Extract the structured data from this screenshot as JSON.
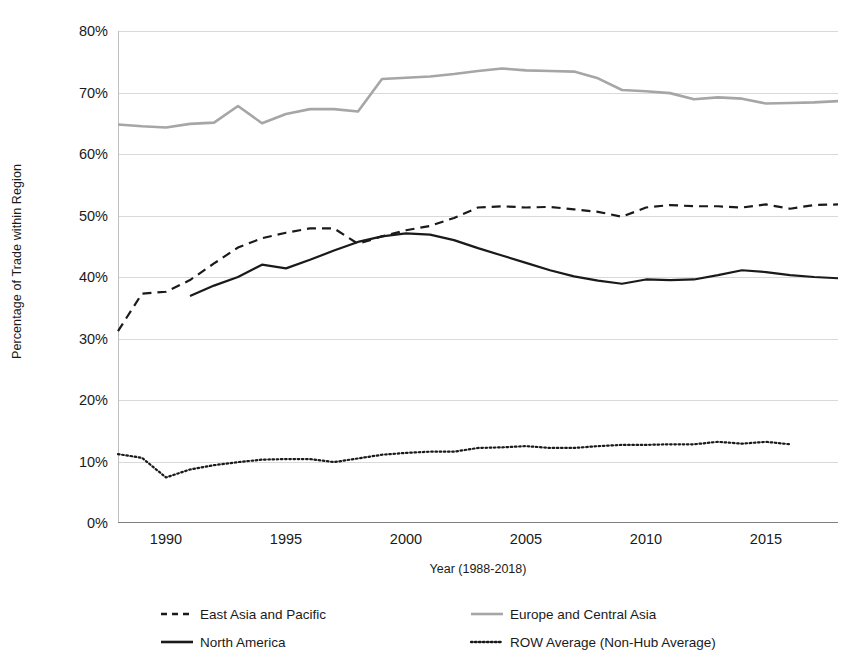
{
  "chart_data": {
    "type": "line",
    "title": "",
    "xlabel": "Year (1988-2018)",
    "ylabel": "Percentage of Trade within Region",
    "xlim": [
      1988,
      2018
    ],
    "ylim": [
      0,
      80
    ],
    "grid": true,
    "legend_position": "bottom",
    "y_ticks": [
      0,
      10,
      20,
      30,
      40,
      50,
      60,
      70,
      80
    ],
    "y_tick_labels": [
      "0%",
      "10%",
      "20%",
      "30%",
      "40%",
      "50%",
      "60%",
      "70%",
      "80%"
    ],
    "x_ticks": [
      1990,
      1995,
      2000,
      2005,
      2010,
      2015
    ],
    "x_tick_labels": [
      "1990",
      "1995",
      "2000",
      "2005",
      "2010",
      "2015"
    ],
    "series": [
      {
        "name": "East Asia and Pacific",
        "style": "dashed",
        "color": "#1a1a1a",
        "x": [
          1988,
          1989,
          1990,
          1991,
          1992,
          1993,
          1994,
          1995,
          1996,
          1997,
          1998,
          1999,
          2000,
          2001,
          2002,
          2003,
          2004,
          2005,
          2006,
          2007,
          2008,
          2009,
          2010,
          2011,
          2012,
          2013,
          2014,
          2015,
          2016,
          2017,
          2018
        ],
        "values": [
          31.2,
          37.3,
          37.6,
          39.5,
          42.2,
          44.8,
          46.3,
          47.2,
          47.9,
          47.9,
          45.4,
          46.6,
          47.6,
          48.3,
          49.6,
          51.3,
          51.5,
          51.3,
          51.4,
          51.0,
          50.6,
          49.8,
          51.3,
          51.7,
          51.5,
          51.5,
          51.3,
          51.8,
          51.1,
          51.7,
          51.8
        ]
      },
      {
        "name": "Europe and Central Asia",
        "style": "solid",
        "color": "#a6a6a6",
        "x": [
          1988,
          1989,
          1990,
          1991,
          1992,
          1993,
          1994,
          1995,
          1996,
          1997,
          1998,
          1999,
          2000,
          2001,
          2002,
          2003,
          2004,
          2005,
          2006,
          2007,
          2008,
          2009,
          2010,
          2011,
          2012,
          2013,
          2014,
          2015,
          2016,
          2017,
          2018
        ],
        "values": [
          64.8,
          64.5,
          64.3,
          64.9,
          65.1,
          67.8,
          65.0,
          66.5,
          67.3,
          67.3,
          66.9,
          72.2,
          72.4,
          72.6,
          73.0,
          73.5,
          73.9,
          73.6,
          73.5,
          73.4,
          72.3,
          70.4,
          70.2,
          69.9,
          68.9,
          69.2,
          69.0,
          68.2,
          68.3,
          68.4,
          68.6
        ]
      },
      {
        "name": "North America",
        "style": "solid",
        "color": "#1a1a1a",
        "x": [
          1991,
          1992,
          1993,
          1994,
          1995,
          1996,
          1997,
          1998,
          1999,
          2000,
          2001,
          2002,
          2003,
          2004,
          2005,
          2006,
          2007,
          2008,
          2009,
          2010,
          2011,
          2012,
          2013,
          2014,
          2015,
          2016,
          2017,
          2018
        ],
        "values": [
          36.9,
          38.6,
          40.0,
          42.0,
          41.4,
          42.8,
          44.3,
          45.7,
          46.6,
          47.1,
          46.9,
          46.0,
          44.7,
          43.5,
          42.3,
          41.1,
          40.1,
          39.4,
          38.9,
          39.6,
          39.5,
          39.6,
          40.3,
          41.1,
          40.8,
          40.3,
          40.0,
          39.8
        ]
      },
      {
        "name": "ROW Average (Non-Hub Average)",
        "style": "dotted",
        "color": "#1a1a1a",
        "x": [
          1988,
          1989,
          1990,
          1991,
          1992,
          1993,
          1994,
          1995,
          1996,
          1997,
          1998,
          1999,
          2000,
          2001,
          2002,
          2003,
          2004,
          2005,
          2006,
          2007,
          2008,
          2009,
          2010,
          2011,
          2012,
          2013,
          2014,
          2015,
          2016
        ],
        "values": [
          11.2,
          10.6,
          7.4,
          8.7,
          9.4,
          9.9,
          10.3,
          10.4,
          10.4,
          9.9,
          10.5,
          11.1,
          11.4,
          11.6,
          11.6,
          12.2,
          12.3,
          12.5,
          12.2,
          12.2,
          12.5,
          12.7,
          12.7,
          12.8,
          12.8,
          13.2,
          12.9,
          13.2,
          12.8
        ]
      }
    ]
  },
  "axes": {
    "y_title": "Percentage of Trade within Region",
    "x_title": "Year (1988-2018)"
  },
  "legend": {
    "items": [
      {
        "label": "East Asia and Pacific",
        "style": "dashed",
        "color": "#1a1a1a"
      },
      {
        "label": "Europe and Central Asia",
        "style": "solid",
        "color": "#a6a6a6"
      },
      {
        "label": "North America",
        "style": "solid",
        "color": "#1a1a1a"
      },
      {
        "label": "ROW Average (Non-Hub Average)",
        "style": "dotted",
        "color": "#1a1a1a"
      }
    ]
  },
  "colors": {
    "gridline": "#d9d9d9",
    "axis": "#7f7f7f",
    "text": "#1a1a1a",
    "background": "#ffffff"
  }
}
